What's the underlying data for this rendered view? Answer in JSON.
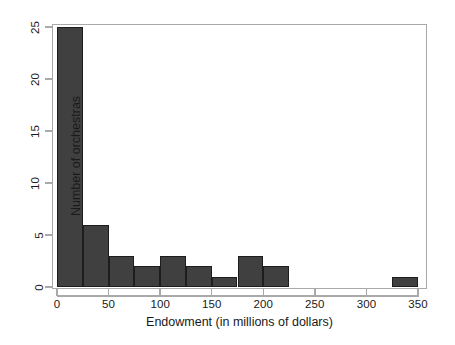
{
  "chart_data": {
    "type": "bar",
    "title": "",
    "subtitle": "",
    "xlabel": "Endowment (in millions of dollars)",
    "ylabel": "Number of orchestras",
    "xlim": [
      0,
      350
    ],
    "ylim": [
      0,
      25
    ],
    "xticks": [
      0,
      50,
      100,
      150,
      200,
      250,
      300,
      350
    ],
    "xtick_labels": [
      "0",
      "50",
      "100",
      "150",
      "200",
      "250",
      "300",
      "350"
    ],
    "yticks": [
      0,
      5,
      10,
      15,
      20,
      25
    ],
    "ytick_labels": [
      "0",
      "5",
      "10",
      "15",
      "20",
      "25"
    ],
    "grid": false,
    "legend": null,
    "bin_width": 25,
    "bar_color": "#404040",
    "bar_edge_color": "#1d1d1d",
    "axis_color": "#a9a9a9",
    "bins": [
      {
        "x0": 0,
        "x1": 25,
        "count": 25
      },
      {
        "x0": 25,
        "x1": 50,
        "count": 6
      },
      {
        "x0": 50,
        "x1": 75,
        "count": 3
      },
      {
        "x0": 75,
        "x1": 100,
        "count": 2
      },
      {
        "x0": 100,
        "x1": 125,
        "count": 3
      },
      {
        "x0": 125,
        "x1": 150,
        "count": 2
      },
      {
        "x0": 150,
        "x1": 175,
        "count": 1
      },
      {
        "x0": 175,
        "x1": 200,
        "count": 3
      },
      {
        "x0": 200,
        "x1": 225,
        "count": 2
      },
      {
        "x0": 225,
        "x1": 250,
        "count": 0
      },
      {
        "x0": 250,
        "x1": 275,
        "count": 0
      },
      {
        "x0": 275,
        "x1": 300,
        "count": 0
      },
      {
        "x0": 300,
        "x1": 325,
        "count": 0
      },
      {
        "x0": 325,
        "x1": 350,
        "count": 1
      }
    ],
    "categories": [
      "0-25",
      "25-50",
      "50-75",
      "75-100",
      "100-125",
      "125-150",
      "150-175",
      "175-200",
      "200-225",
      "225-250",
      "250-275",
      "275-300",
      "300-325",
      "325-350"
    ],
    "values": [
      25,
      6,
      3,
      2,
      3,
      2,
      1,
      3,
      2,
      0,
      0,
      0,
      0,
      1
    ]
  }
}
